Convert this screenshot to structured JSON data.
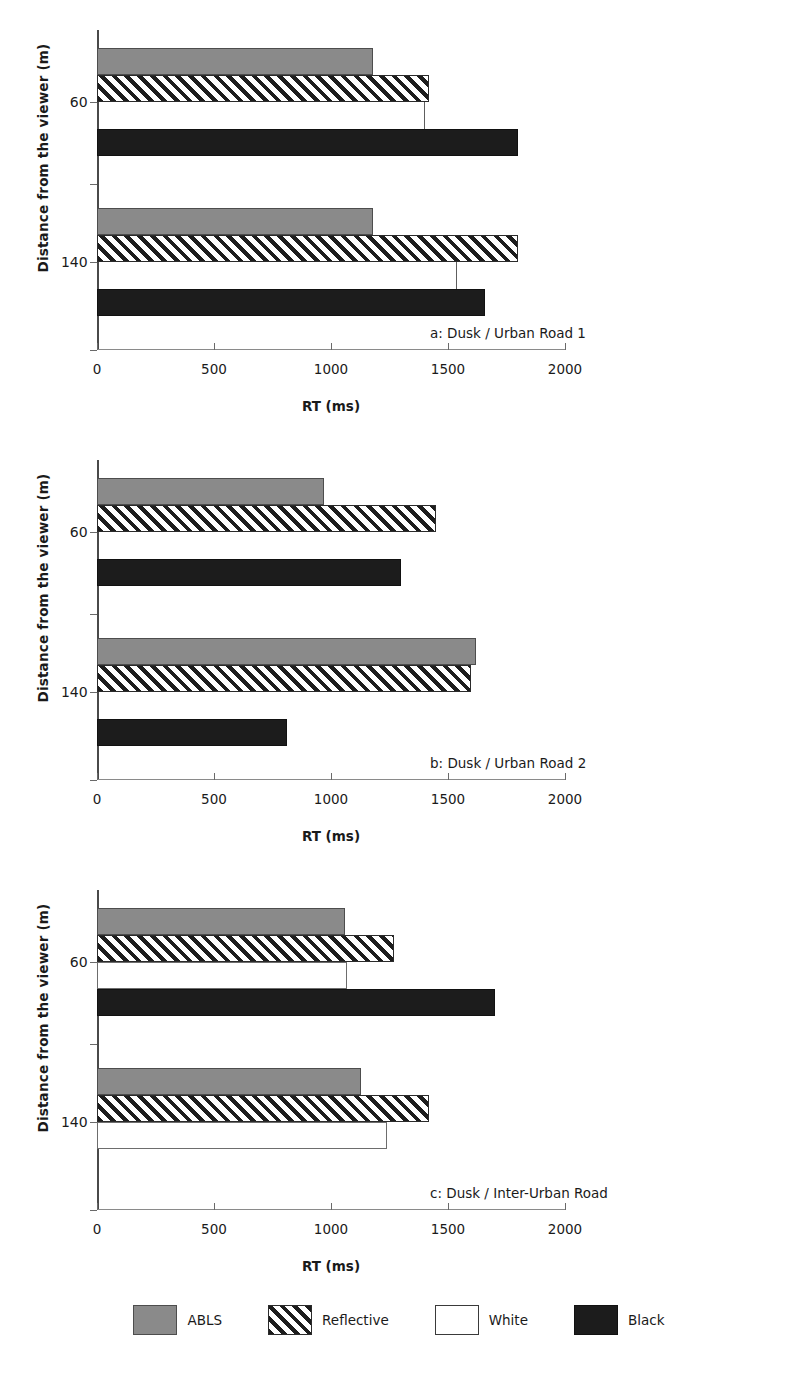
{
  "figure": {
    "panels": [
      {
        "id": "a",
        "caption": "a: Dusk / Urban Road 1",
        "xlabel": "RT (ms)",
        "ylabel": "Distance from the viewer (m)"
      },
      {
        "id": "b",
        "caption": "b: Dusk / Urban Road 2",
        "xlabel": "RT (ms)",
        "ylabel": "Distance from the viewer (m)"
      },
      {
        "id": "c",
        "caption": "c: Dusk / Inter-Urban Road",
        "xlabel": "RT (ms)",
        "ylabel": "Distance from the viewer (m)"
      }
    ],
    "xticks": [
      "0",
      "500",
      "1000",
      "1500",
      "2000"
    ],
    "yticks": [
      "60",
      "140"
    ],
    "legend": [
      {
        "key": "abls",
        "label": "ABLS",
        "color": "#8a8a8a"
      },
      {
        "key": "reflective",
        "label": "Reflective",
        "color": "#1d1d1d"
      },
      {
        "key": "white",
        "label": "White",
        "color": "#ffffff"
      },
      {
        "key": "black",
        "label": "Black",
        "color": "#1c1c1c"
      }
    ]
  },
  "chart_data": [
    {
      "type": "bar",
      "orientation": "horizontal",
      "title": "a: Dusk / Urban Road 1",
      "xlabel": "RT (ms)",
      "ylabel": "Distance from the viewer (m)",
      "xlim": [
        0,
        2000
      ],
      "xticks": [
        0,
        500,
        1000,
        1500,
        2000
      ],
      "categories": [
        "60",
        "140"
      ],
      "grid": false,
      "legend_position": "bottom",
      "series": [
        {
          "name": "ABLS",
          "values": [
            1180,
            1180
          ]
        },
        {
          "name": "Reflective",
          "values": [
            1420,
            1800
          ]
        },
        {
          "name": "White",
          "values": [
            1400,
            1540
          ]
        },
        {
          "name": "Black",
          "values": [
            1800,
            1660
          ]
        }
      ]
    },
    {
      "type": "bar",
      "orientation": "horizontal",
      "title": "b: Dusk / Urban Road 2",
      "xlabel": "RT (ms)",
      "ylabel": "Distance from the viewer (m)",
      "xlim": [
        0,
        2000
      ],
      "xticks": [
        0,
        500,
        1000,
        1500,
        2000
      ],
      "categories": [
        "60",
        "140"
      ],
      "grid": false,
      "legend_position": "bottom",
      "series": [
        {
          "name": "ABLS",
          "values": [
            970,
            1620
          ]
        },
        {
          "name": "Reflective",
          "values": [
            1450,
            1600
          ]
        },
        {
          "name": "White",
          "values": [
            0,
            0
          ]
        },
        {
          "name": "Black",
          "values": [
            1300,
            810
          ]
        }
      ]
    },
    {
      "type": "bar",
      "orientation": "horizontal",
      "title": "c: Dusk / Inter-Urban Road",
      "xlabel": "RT (ms)",
      "ylabel": "Distance from the viewer (m)",
      "xlim": [
        0,
        2000
      ],
      "xticks": [
        0,
        500,
        1000,
        1500,
        2000
      ],
      "categories": [
        "60",
        "140"
      ],
      "grid": false,
      "legend_position": "bottom",
      "series": [
        {
          "name": "ABLS",
          "values": [
            1060,
            1130
          ]
        },
        {
          "name": "Reflective",
          "values": [
            1270,
            1420
          ]
        },
        {
          "name": "White",
          "values": [
            1070,
            1240
          ]
        },
        {
          "name": "Black",
          "values": [
            1700,
            0
          ]
        }
      ]
    }
  ]
}
